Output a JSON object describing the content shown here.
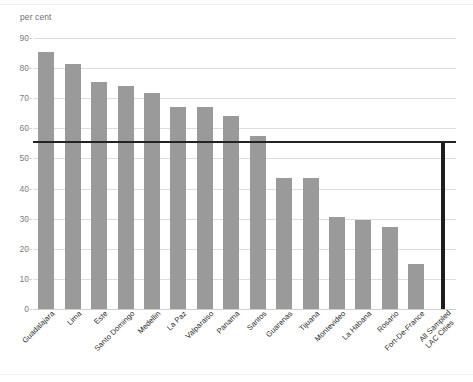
{
  "chart_data": {
    "type": "bar",
    "title": "",
    "subtitle": "",
    "xlabel": "",
    "ylabel": "per cent",
    "ylim": [
      0,
      90
    ],
    "ytick_values": [
      0,
      10,
      20,
      30,
      40,
      50,
      60,
      70,
      80,
      90
    ],
    "ytick_labels": [
      "0",
      "10",
      "20",
      "30",
      "40",
      "50",
      "60",
      "70",
      "80",
      "90"
    ],
    "grid": true,
    "legend": "none",
    "categories": [
      "Guadalajara",
      "Lima",
      "Este",
      "Santo Domingo",
      "Medellin",
      "La Paz",
      "Valparaiso",
      "Panama",
      "Santos",
      "Guarenas",
      "Tijuana",
      "Montevideo",
      "La Habana",
      "Rosario",
      "Fort-De-France",
      "All Sampled LAC Cities"
    ],
    "values": [
      85.5,
      81.5,
      75.3,
      74.2,
      71.8,
      67.1,
      67.1,
      64.2,
      57.4,
      43.6,
      43.5,
      30.4,
      29.5,
      27.4,
      15.1,
      55.5
    ],
    "reference_line": {
      "label": "All Sampled LAC Cities average",
      "value": 55.5,
      "color": "#232323"
    },
    "bar_color": "#9a9a9a",
    "accent_bar_color": "#1d1d1d",
    "accent_bar_index": 15,
    "gridline_color": "#dddddd"
  },
  "axis": {
    "unit_label": "per cent"
  }
}
